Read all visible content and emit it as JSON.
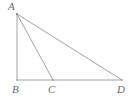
{
  "figure": {
    "type": "geometry-diagram",
    "canvas": {
      "width": 134,
      "height": 101
    },
    "background_color": "#ffffff",
    "stroke_color": "#8a8a8a",
    "stroke_width": 0.8,
    "label_color": "#6b6b6b",
    "label_font_size": 11,
    "label_style": "italic-serif",
    "points": [
      {
        "id": "A",
        "label": "A",
        "x": 17,
        "y": 14,
        "label_x": 8,
        "label_y": 1
      },
      {
        "id": "B",
        "label": "B",
        "x": 17,
        "y": 80,
        "label_x": 12,
        "label_y": 84
      },
      {
        "id": "C",
        "label": "C",
        "x": 53,
        "y": 80,
        "label_x": 48,
        "label_y": 84
      },
      {
        "id": "D",
        "label": "D",
        "x": 122,
        "y": 80,
        "label_x": 117,
        "label_y": 84
      }
    ],
    "segments": [
      {
        "id": "AB",
        "name": "segment-ab",
        "from": "A",
        "to": "B",
        "x1": 17,
        "y1": 14,
        "x2": 17,
        "y2": 80
      },
      {
        "id": "BD",
        "name": "segment-bd",
        "from": "B",
        "to": "D",
        "x1": 17,
        "y1": 80,
        "x2": 122,
        "y2": 80
      },
      {
        "id": "AD",
        "name": "segment-ad",
        "from": "A",
        "to": "D",
        "x1": 17,
        "y1": 14,
        "x2": 122,
        "y2": 80
      },
      {
        "id": "AC",
        "name": "segment-ac",
        "from": "A",
        "to": "C",
        "x1": 17,
        "y1": 14,
        "x2": 53,
        "y2": 80
      }
    ]
  }
}
